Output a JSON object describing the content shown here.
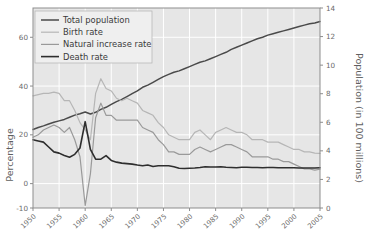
{
  "chart_data": {
    "type": "line",
    "title": "",
    "xlabel": "",
    "ylabel": "Percentage",
    "ylabel_right": "Population (in 100 millions)",
    "x": [
      1950,
      1951,
      1952,
      1953,
      1954,
      1955,
      1956,
      1957,
      1958,
      1959,
      1960,
      1961,
      1962,
      1963,
      1964,
      1965,
      1966,
      1967,
      1968,
      1969,
      1970,
      1971,
      1972,
      1973,
      1974,
      1975,
      1976,
      1977,
      1978,
      1979,
      1980,
      1981,
      1982,
      1983,
      1984,
      1985,
      1986,
      1987,
      1988,
      1989,
      1990,
      1991,
      1992,
      1993,
      1994,
      1995,
      1996,
      1997,
      1998,
      1999,
      2000,
      2001,
      2002,
      2003,
      2004,
      2005
    ],
    "xticks": [
      "1950",
      "1955",
      "1960",
      "1965",
      "1970",
      "1975",
      "1980",
      "1985",
      "1990",
      "1995",
      "2000",
      "2005"
    ],
    "yticks_left": [
      -10,
      0,
      20,
      40,
      60
    ],
    "yticks_right": [
      0,
      2,
      4,
      6,
      8,
      10,
      12,
      14
    ],
    "ylim_left": [
      -10,
      72
    ],
    "ylim_right": [
      0,
      14
    ],
    "grid": true,
    "legend_position": "top-left",
    "series": [
      {
        "name": "Total population",
        "axis": "right",
        "color": "#4a4a4a",
        "width": 1.5,
        "values": [
          5.5,
          5.63,
          5.75,
          5.88,
          6.0,
          6.1,
          6.2,
          6.35,
          6.5,
          6.6,
          6.72,
          6.58,
          6.7,
          6.9,
          7.05,
          7.25,
          7.45,
          7.6,
          7.8,
          8.0,
          8.2,
          8.45,
          8.6,
          8.8,
          9.0,
          9.2,
          9.35,
          9.5,
          9.6,
          9.75,
          9.9,
          10.05,
          10.2,
          10.3,
          10.45,
          10.6,
          10.75,
          10.9,
          11.1,
          11.25,
          11.4,
          11.55,
          11.7,
          11.85,
          11.95,
          12.1,
          12.2,
          12.3,
          12.4,
          12.5,
          12.6,
          12.7,
          12.8,
          12.9,
          12.95,
          13.05
        ]
      },
      {
        "name": "Birth rate",
        "axis": "left",
        "color": "#b6b6b6",
        "width": 1.2,
        "values": [
          36,
          36.5,
          37,
          37,
          37.5,
          37,
          34,
          34,
          30,
          25,
          22,
          18,
          37,
          43,
          39,
          38,
          35,
          34,
          35,
          34,
          33,
          30,
          29,
          28,
          25,
          23,
          20,
          19,
          18,
          18,
          18,
          21,
          22,
          20,
          18,
          21,
          22,
          23,
          22,
          21,
          21,
          20,
          18,
          18,
          18,
          17,
          17,
          17,
          16,
          15,
          14,
          14,
          13,
          13,
          12.5,
          12.4
        ]
      },
      {
        "name": "Natural increase rate",
        "axis": "left",
        "color": "#9a9a9a",
        "width": 1.2,
        "values": [
          19,
          20,
          22,
          23,
          24,
          23,
          21,
          23,
          18,
          11,
          -9,
          4,
          27,
          33,
          28,
          28,
          26,
          26,
          26,
          26,
          26,
          23,
          22,
          21,
          18,
          16,
          13,
          13,
          12,
          12,
          12,
          14,
          15,
          14,
          13,
          14,
          15,
          16,
          16,
          15,
          14,
          13,
          11,
          11,
          11,
          11,
          10,
          10,
          9,
          9,
          8,
          7,
          6,
          6,
          5.5,
          5.9
        ]
      },
      {
        "name": "Death rate",
        "axis": "left",
        "color": "#2e2e2e",
        "width": 1.6,
        "values": [
          18,
          17.5,
          17,
          15,
          13,
          12.5,
          11.5,
          10.8,
          12,
          14.6,
          25.4,
          14,
          10,
          10,
          11.5,
          9.5,
          8.8,
          8.4,
          8.2,
          8.0,
          7.6,
          7.3,
          7.6,
          7.0,
          7.3,
          7.3,
          7.3,
          6.9,
          6.3,
          6.2,
          6.3,
          6.4,
          6.6,
          6.9,
          6.8,
          6.8,
          6.9,
          6.7,
          6.6,
          6.5,
          6.7,
          6.7,
          6.6,
          6.6,
          6.5,
          6.6,
          6.6,
          6.5,
          6.5,
          6.5,
          6.5,
          6.4,
          6.4,
          6.4,
          6.4,
          6.5
        ]
      }
    ]
  },
  "legend": {
    "items": [
      {
        "label": "Total population"
      },
      {
        "label": "Birth rate"
      },
      {
        "label": "Natural increase rate"
      },
      {
        "label": "Death rate"
      }
    ]
  }
}
